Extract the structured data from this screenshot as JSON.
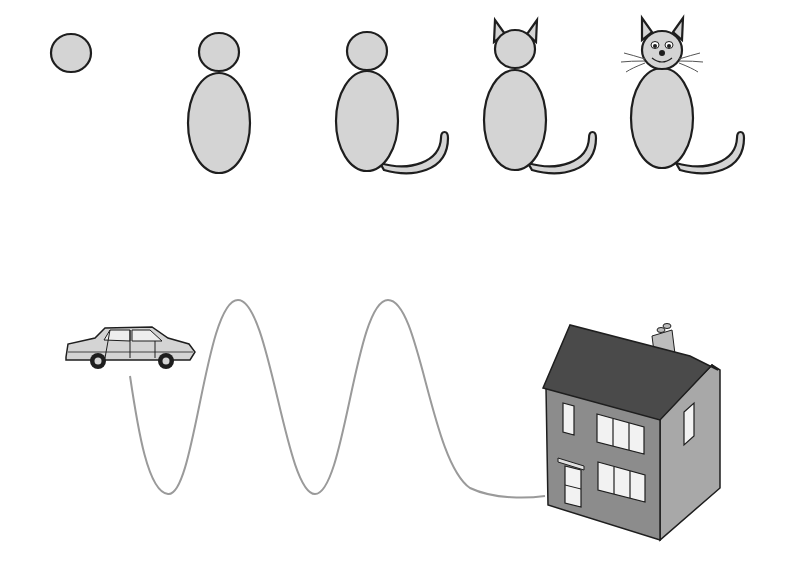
{
  "scene": {
    "description": "Step-by-step cat drawing sequence and a winding path from car to house",
    "cat_steps": [
      {
        "step": 1,
        "label": "head circle"
      },
      {
        "step": 2,
        "label": "head and body"
      },
      {
        "step": 3,
        "label": "add tail"
      },
      {
        "step": 4,
        "label": "add ears"
      },
      {
        "step": 5,
        "label": "add face and whiskers"
      }
    ],
    "path": {
      "from": "car",
      "to": "house",
      "peaks": 2
    },
    "colors": {
      "fill": "#d4d4d4",
      "outline": "#1e1e1e",
      "path": "#9a9a9a",
      "roof": "#4a4a4a",
      "wall": "#8c8c8c",
      "wall_side": "#a8a8a8"
    }
  }
}
